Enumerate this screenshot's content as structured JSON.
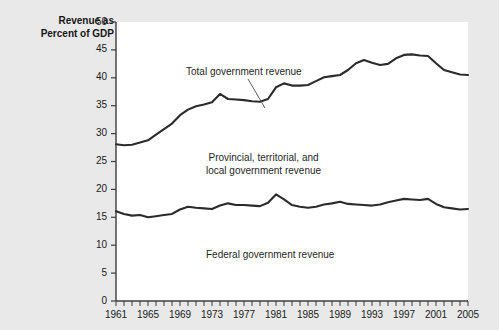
{
  "axis_title": {
    "line1": "Revenue as",
    "line2": "Percent of GDP"
  },
  "annotations": {
    "total": "Total government revenue",
    "provincial_line1": "Provincial, territorial, and",
    "provincial_line2": "local government revenue",
    "federal": "Federal government revenue"
  },
  "colors": {
    "background": "#e9e9e9",
    "plot_background": "#ffffff",
    "line": "#2b2b2b",
    "text": "#1a1a1a",
    "axis": "#4a4a4a"
  },
  "chart_data": {
    "type": "line",
    "title": "",
    "subtitle": "",
    "xlabel": "",
    "ylabel": "Revenue as Percent of GDP",
    "xlim": [
      1961,
      2005
    ],
    "ylim": [
      0,
      50
    ],
    "yticks": [
      0,
      5,
      10,
      15,
      20,
      25,
      30,
      35,
      40,
      45,
      50
    ],
    "xticks": [
      1961,
      1965,
      1969,
      1973,
      1977,
      1981,
      1985,
      1989,
      1993,
      1997,
      2001,
      2005
    ],
    "xtick_minor_step": 1,
    "grid": false,
    "legend": "inline-annotations",
    "x": [
      1961,
      1962,
      1963,
      1964,
      1965,
      1966,
      1967,
      1968,
      1969,
      1970,
      1971,
      1972,
      1973,
      1974,
      1975,
      1976,
      1977,
      1978,
      1979,
      1980,
      1981,
      1982,
      1983,
      1984,
      1985,
      1986,
      1987,
      1988,
      1989,
      1990,
      1991,
      1992,
      1993,
      1994,
      1995,
      1996,
      1997,
      1998,
      1999,
      2000,
      2001,
      2002,
      2003,
      2004,
      2005
    ],
    "series": [
      {
        "name": "Total government revenue",
        "values": [
          28.1,
          27.9,
          28.0,
          28.4,
          28.8,
          29.8,
          30.8,
          31.8,
          33.3,
          34.3,
          34.9,
          35.2,
          35.6,
          37.1,
          36.2,
          36.1,
          36.0,
          35.8,
          35.7,
          36.2,
          38.3,
          39.0,
          38.6,
          38.6,
          38.7,
          39.4,
          40.1,
          40.3,
          40.5,
          41.4,
          42.6,
          43.2,
          42.7,
          42.3,
          42.5,
          43.5,
          44.1,
          44.2,
          44.0,
          43.9,
          42.6,
          41.4,
          41.0,
          40.6,
          40.5
        ]
      },
      {
        "name": "Federal government revenue",
        "values": [
          16.1,
          15.6,
          15.3,
          15.4,
          15.0,
          15.2,
          15.4,
          15.6,
          16.4,
          16.9,
          16.7,
          16.6,
          16.5,
          17.1,
          17.5,
          17.2,
          17.2,
          17.1,
          17.0,
          17.6,
          19.1,
          18.2,
          17.2,
          16.9,
          16.7,
          16.9,
          17.3,
          17.5,
          17.8,
          17.4,
          17.3,
          17.2,
          17.1,
          17.3,
          17.7,
          18.0,
          18.3,
          18.2,
          18.1,
          18.3,
          17.4,
          16.8,
          16.6,
          16.4,
          16.5
        ]
      }
    ]
  }
}
